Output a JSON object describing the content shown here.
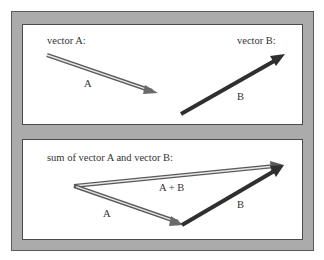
{
  "top_panel": {
    "vector_a_heading": "vector A:",
    "vector_b_heading": "vector B:",
    "vector_a_label": "A",
    "vector_b_label": "B"
  },
  "bottom_panel": {
    "heading": "sum of vector A and vector B:",
    "vector_a_label": "A",
    "vector_b_label": "B",
    "sum_label": "A + B"
  },
  "colors": {
    "frame": "#ababab",
    "frame_border": "#5a5a5a",
    "panel": "#ffffff",
    "vector_a_outline": "#555555",
    "vector_a_fill": "#e8e8e8",
    "vector_b": "#333333",
    "text": "#333333"
  }
}
